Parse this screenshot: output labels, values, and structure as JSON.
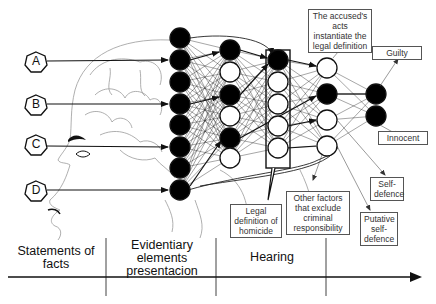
{
  "inputs": [
    {
      "id": "A",
      "label": "A",
      "y": 61
    },
    {
      "id": "B",
      "label": "B",
      "y": 104
    },
    {
      "id": "C",
      "label": "C",
      "y": 144
    },
    {
      "id": "D",
      "label": "D",
      "y": 190
    }
  ],
  "layers": [
    {
      "name": "layer-1",
      "x": 180,
      "r": 10,
      "nodes": [
        {
          "y": 38,
          "filled": true
        },
        {
          "y": 60,
          "filled": true
        },
        {
          "y": 82,
          "filled": true
        },
        {
          "y": 104,
          "filled": true
        },
        {
          "y": 125,
          "filled": true
        },
        {
          "y": 147,
          "filled": true
        },
        {
          "y": 168,
          "filled": true
        },
        {
          "y": 190,
          "filled": true
        }
      ]
    },
    {
      "name": "layer-2",
      "x": 230,
      "r": 10,
      "nodes": [
        {
          "y": 50,
          "filled": true
        },
        {
          "y": 72,
          "filled": false
        },
        {
          "y": 95,
          "filled": true
        },
        {
          "y": 116,
          "filled": false
        },
        {
          "y": 138,
          "filled": true
        },
        {
          "y": 158,
          "filled": false
        }
      ]
    },
    {
      "name": "layer-3",
      "x": 278,
      "r": 10,
      "nodes": [
        {
          "y": 60,
          "filled": true
        },
        {
          "y": 82,
          "filled": false
        },
        {
          "y": 104,
          "filled": false
        },
        {
          "y": 126,
          "filled": false
        },
        {
          "y": 148,
          "filled": false
        }
      ]
    },
    {
      "name": "layer-4",
      "x": 327,
      "r": 10,
      "nodes": [
        {
          "y": 68,
          "filled": false
        },
        {
          "y": 94,
          "filled": true
        },
        {
          "y": 120,
          "filled": false
        },
        {
          "y": 146,
          "filled": false
        }
      ]
    },
    {
      "name": "layer-5",
      "x": 376,
      "r": 10,
      "nodes": [
        {
          "y": 94,
          "filled": true
        },
        {
          "y": 116,
          "filled": true
        }
      ]
    }
  ],
  "labels": {
    "accused_acts": "The accused's acts instantiate the legal definition",
    "guilty": "Guilty",
    "innocent": "Innocent",
    "self_defence": "Self-defence",
    "putative_self_defence": "Putative self-defence",
    "other_factors": "Other factors that exclude criminal responsibility",
    "legal_definition": "Legal definition of homicide"
  },
  "timeline": {
    "phases": [
      {
        "label": "Statements of facts"
      },
      {
        "label": "Evidentiary elements presentacion"
      },
      {
        "label": "Hearing"
      },
      {
        "label": ""
      }
    ]
  },
  "colors": {
    "node_fill": "#000000",
    "node_stroke": "#111111",
    "line": "#222222",
    "brain_line": "#9a9a9a",
    "box_border": "#555555"
  }
}
